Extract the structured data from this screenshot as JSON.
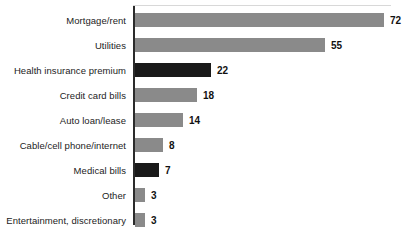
{
  "chart_data": {
    "type": "bar",
    "orientation": "horizontal",
    "title": "",
    "xlabel": "",
    "ylabel": "",
    "xlim": [
      0,
      72
    ],
    "grid": false,
    "legend": "none",
    "value_suffix": "",
    "categories": [
      "Mortgage/rent",
      "Utilities",
      "Health insurance premium",
      "Credit card bills",
      "Auto loan/lease",
      "Cable/cell phone/internet",
      "Medical bills",
      "Other",
      "Entertainment, discretionary"
    ],
    "values": [
      72,
      55,
      22,
      18,
      14,
      8,
      7,
      3,
      3
    ],
    "value_labels": [
      "72",
      "55",
      "22",
      "18",
      "14",
      "8",
      "7",
      "3",
      "3"
    ],
    "bar_colors": [
      "#8a8a8a",
      "#8a8a8a",
      "#1a1a1a",
      "#8a8a8a",
      "#8a8a8a",
      "#8a8a8a",
      "#1a1a1a",
      "#8a8a8a",
      "#8a8a8a"
    ],
    "color_key": {
      "gray": "#8a8a8a",
      "black": "#1a1a1a",
      "axis": "#2b2b2b",
      "text": "#1c1c1c",
      "background": "#ffffff"
    }
  }
}
